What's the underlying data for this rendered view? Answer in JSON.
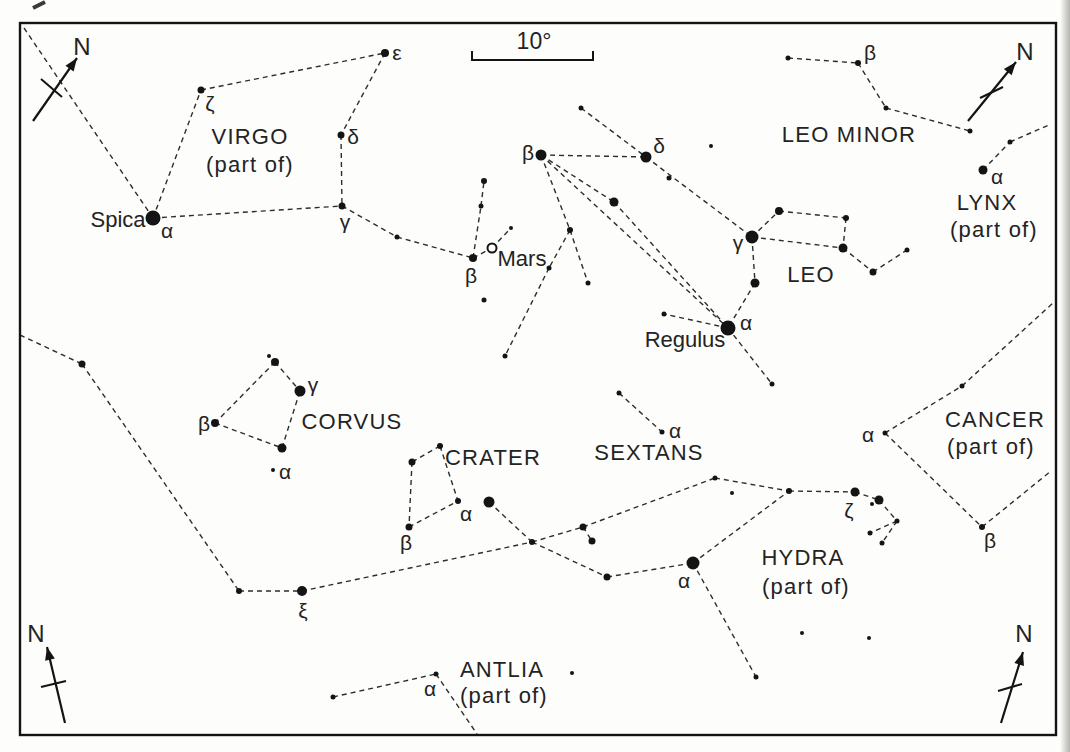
{
  "canvas": {
    "width": 1070,
    "height": 752,
    "background": "#fdfdfb",
    "ink": "#141414",
    "line_color": "#2d2d2d",
    "text_color": "#232323",
    "border": {
      "x": 20,
      "y": 23,
      "width": 1036,
      "height": 712,
      "stroke_width": 2.4
    },
    "page_edge_color": "#bdbdb9"
  },
  "scale_bar": {
    "label": "10°",
    "x1": 472,
    "x2": 593,
    "y": 60,
    "tick_height": 9,
    "label_x": 534,
    "label_y": 41
  },
  "compass_arrows": [
    {
      "id": "north-arrow-top-left",
      "label": "N",
      "shaft": [
        33,
        121,
        77,
        58
      ],
      "tick": [
        41,
        79,
        62,
        97
      ],
      "label_pos": [
        82,
        46
      ]
    },
    {
      "id": "north-arrow-top-right",
      "label": "N",
      "shaft": [
        968,
        121,
        1016,
        62
      ],
      "tick": [
        980,
        98,
        1003,
        87
      ],
      "label_pos": [
        1025,
        51
      ]
    },
    {
      "id": "north-arrow-bottom-left",
      "label": "N",
      "shaft": [
        65,
        723,
        47,
        647
      ],
      "tick": [
        41,
        687,
        66,
        681
      ],
      "label_pos": [
        36,
        633
      ]
    },
    {
      "id": "north-arrow-bottom-right",
      "label": "N",
      "shaft": [
        1001,
        723,
        1023,
        652
      ],
      "tick": [
        998,
        691,
        1022,
        684
      ],
      "label_pos": [
        1024,
        633
      ]
    }
  ],
  "constellation_names": [
    {
      "text": "VIRGO",
      "x": 250,
      "y": 136
    },
    {
      "text": "(part of)",
      "x": 250,
      "y": 164
    },
    {
      "text": "LEO MINOR",
      "x": 849,
      "y": 134
    },
    {
      "text": "LYNX",
      "x": 987,
      "y": 202
    },
    {
      "text": "(part of)",
      "x": 994,
      "y": 229
    },
    {
      "text": "LEO",
      "x": 811,
      "y": 274
    },
    {
      "text": "CANCER",
      "x": 995,
      "y": 419
    },
    {
      "text": "(part of)",
      "x": 991,
      "y": 446
    },
    {
      "text": "CORVUS",
      "x": 352,
      "y": 421
    },
    {
      "text": "CRATER",
      "x": 493,
      "y": 457
    },
    {
      "text": "SEXTANS",
      "x": 649,
      "y": 452
    },
    {
      "text": "HYDRA",
      "x": 803,
      "y": 557
    },
    {
      "text": "(part of)",
      "x": 806,
      "y": 586
    },
    {
      "text": "ANTLIA",
      "x": 502,
      "y": 669
    },
    {
      "text": "(part of)",
      "x": 504,
      "y": 695
    }
  ],
  "star_names": [
    {
      "text": "Spica",
      "x": 118,
      "y": 219
    },
    {
      "text": "Regulus",
      "x": 685,
      "y": 339
    },
    {
      "text": "Mars",
      "x": 522,
      "y": 258
    }
  ],
  "greek_labels": [
    {
      "text": "ζ",
      "x": 210,
      "y": 103
    },
    {
      "text": "ε",
      "x": 397,
      "y": 52
    },
    {
      "text": "δ",
      "x": 353,
      "y": 136
    },
    {
      "text": "γ",
      "x": 345,
      "y": 221
    },
    {
      "text": "α",
      "x": 167,
      "y": 230
    },
    {
      "text": "β",
      "x": 471,
      "y": 275
    },
    {
      "text": "β",
      "x": 528,
      "y": 152
    },
    {
      "text": "δ",
      "x": 659,
      "y": 145
    },
    {
      "text": "γ",
      "x": 738,
      "y": 242
    },
    {
      "text": "α",
      "x": 746,
      "y": 322
    },
    {
      "text": "β",
      "x": 870,
      "y": 52
    },
    {
      "text": "α",
      "x": 997,
      "y": 176
    },
    {
      "text": "α",
      "x": 868,
      "y": 434
    },
    {
      "text": "β",
      "x": 990,
      "y": 540
    },
    {
      "text": "γ",
      "x": 313,
      "y": 384
    },
    {
      "text": "β",
      "x": 204,
      "y": 423
    },
    {
      "text": "α",
      "x": 285,
      "y": 471
    },
    {
      "text": "α",
      "x": 466,
      "y": 513
    },
    {
      "text": "β",
      "x": 406,
      "y": 542
    },
    {
      "text": "α",
      "x": 675,
      "y": 430
    },
    {
      "text": "ξ",
      "x": 303,
      "y": 610
    },
    {
      "text": "α",
      "x": 684,
      "y": 580
    },
    {
      "text": "ζ",
      "x": 849,
      "y": 510
    },
    {
      "text": "α",
      "x": 430,
      "y": 688
    }
  ],
  "mars_marker": {
    "x": 492,
    "y": 248,
    "r": 4.5
  },
  "stars": [
    [
      153,
      218,
      7.5
    ],
    [
      201,
      90,
      3.5
    ],
    [
      385,
      53,
      4
    ],
    [
      341,
      135,
      3.5
    ],
    [
      342,
      206,
      3.5
    ],
    [
      397,
      237,
      2.5
    ],
    [
      473,
      258,
      4
    ],
    [
      481,
      206,
      2.5
    ],
    [
      484,
      181,
      3
    ],
    [
      511,
      228,
      2
    ],
    [
      484,
      300,
      2.5
    ],
    [
      541,
      155,
      5.5
    ],
    [
      646,
      157,
      5.5
    ],
    [
      581,
      108,
      2.5
    ],
    [
      711,
      146,
      2
    ],
    [
      669,
      178,
      2.5
    ],
    [
      614,
      202,
      4.5
    ],
    [
      570,
      230,
      3
    ],
    [
      549,
      268,
      2.5
    ],
    [
      505,
      356,
      2.5
    ],
    [
      588,
      283,
      2.5
    ],
    [
      752,
      237,
      6.5
    ],
    [
      779,
      211,
      4
    ],
    [
      846,
      218,
      3
    ],
    [
      843,
      248,
      4.5
    ],
    [
      873,
      272,
      3.5
    ],
    [
      907,
      250,
      2.5
    ],
    [
      755,
      283,
      4.5
    ],
    [
      728,
      328,
      7.5
    ],
    [
      664,
      314,
      2.5
    ],
    [
      772,
      384,
      2.5
    ],
    [
      788,
      58,
      2.5
    ],
    [
      858,
      63,
      3
    ],
    [
      886,
      108,
      2.5
    ],
    [
      970,
      131,
      2.5
    ],
    [
      983,
      170,
      4.5
    ],
    [
      1010,
      142,
      2.5
    ],
    [
      885,
      433,
      2.5
    ],
    [
      962,
      386,
      2.5
    ],
    [
      982,
      527,
      3
    ],
    [
      269,
      356,
      2
    ],
    [
      275,
      362,
      4
    ],
    [
      300,
      391,
      5.5
    ],
    [
      215,
      423,
      4
    ],
    [
      282,
      448,
      4.5
    ],
    [
      273,
      470,
      2
    ],
    [
      440,
      446,
      3
    ],
    [
      412,
      462,
      3.5
    ],
    [
      409,
      527,
      3.5
    ],
    [
      458,
      501,
      3
    ],
    [
      489,
      502,
      5.5
    ],
    [
      619,
      393,
      2.5
    ],
    [
      662,
      432,
      2.5
    ],
    [
      82,
      364,
      3.5
    ],
    [
      239,
      591,
      3
    ],
    [
      302,
      591,
      5
    ],
    [
      532,
      542,
      3
    ],
    [
      583,
      527,
      3.5
    ],
    [
      592,
      541,
      3.5
    ],
    [
      607,
      577,
      3.5
    ],
    [
      693,
      563,
      6.5
    ],
    [
      715,
      478,
      2.5
    ],
    [
      732,
      493,
      2
    ],
    [
      789,
      491,
      3
    ],
    [
      855,
      492,
      4.5
    ],
    [
      872,
      504,
      2
    ],
    [
      879,
      500,
      4.5
    ],
    [
      897,
      521,
      2.5
    ],
    [
      870,
      533,
      2.5
    ],
    [
      882,
      543,
      2.5
    ],
    [
      756,
      677,
      2.5
    ],
    [
      802,
      633,
      2
    ],
    [
      869,
      638,
      2
    ],
    [
      333,
      697,
      2.5
    ],
    [
      436,
      674,
      2.5
    ],
    [
      572,
      673,
      2
    ]
  ],
  "lines": [
    [
      24,
      28,
      153,
      218
    ],
    [
      153,
      218,
      201,
      90
    ],
    [
      201,
      90,
      385,
      53
    ],
    [
      385,
      53,
      341,
      135
    ],
    [
      341,
      135,
      342,
      206
    ],
    [
      153,
      218,
      342,
      206
    ],
    [
      342,
      206,
      397,
      237
    ],
    [
      397,
      237,
      473,
      258
    ],
    [
      473,
      258,
      481,
      206
    ],
    [
      481,
      206,
      484,
      181
    ],
    [
      473,
      258,
      492,
      248
    ],
    [
      492,
      248,
      511,
      228
    ],
    [
      581,
      108,
      646,
      157
    ],
    [
      541,
      155,
      646,
      157
    ],
    [
      646,
      157,
      752,
      237
    ],
    [
      541,
      155,
      614,
      202
    ],
    [
      614,
      202,
      728,
      328
    ],
    [
      541,
      155,
      728,
      328
    ],
    [
      541,
      155,
      570,
      230
    ],
    [
      570,
      230,
      549,
      268
    ],
    [
      549,
      268,
      505,
      356
    ],
    [
      570,
      230,
      588,
      283
    ],
    [
      752,
      237,
      779,
      211
    ],
    [
      779,
      211,
      846,
      218
    ],
    [
      846,
      218,
      843,
      248
    ],
    [
      752,
      237,
      843,
      248
    ],
    [
      843,
      248,
      873,
      272
    ],
    [
      873,
      272,
      907,
      250
    ],
    [
      752,
      237,
      755,
      283
    ],
    [
      755,
      283,
      728,
      328
    ],
    [
      728,
      328,
      664,
      314
    ],
    [
      728,
      328,
      772,
      384
    ],
    [
      788,
      58,
      858,
      63
    ],
    [
      858,
      63,
      886,
      108
    ],
    [
      886,
      108,
      970,
      131
    ],
    [
      983,
      170,
      1010,
      142
    ],
    [
      1010,
      142,
      1051,
      124
    ],
    [
      885,
      433,
      962,
      386
    ],
    [
      962,
      386,
      1053,
      303
    ],
    [
      885,
      433,
      982,
      527
    ],
    [
      982,
      527,
      1051,
      471
    ],
    [
      275,
      362,
      300,
      391
    ],
    [
      275,
      362,
      215,
      423
    ],
    [
      215,
      423,
      282,
      448
    ],
    [
      282,
      448,
      300,
      391
    ],
    [
      440,
      446,
      412,
      462
    ],
    [
      412,
      462,
      409,
      527
    ],
    [
      409,
      527,
      458,
      501
    ],
    [
      440,
      446,
      458,
      501
    ],
    [
      489,
      502,
      532,
      542
    ],
    [
      619,
      393,
      662,
      432
    ],
    [
      20,
      335,
      82,
      364
    ],
    [
      82,
      364,
      239,
      591
    ],
    [
      239,
      591,
      302,
      591
    ],
    [
      302,
      591,
      532,
      542
    ],
    [
      532,
      542,
      583,
      527
    ],
    [
      583,
      527,
      592,
      541
    ],
    [
      583,
      527,
      715,
      478
    ],
    [
      532,
      542,
      607,
      577
    ],
    [
      607,
      577,
      693,
      563
    ],
    [
      693,
      563,
      789,
      491
    ],
    [
      715,
      478,
      789,
      491
    ],
    [
      789,
      491,
      855,
      492
    ],
    [
      855,
      492,
      879,
      500
    ],
    [
      879,
      500,
      897,
      521
    ],
    [
      897,
      521,
      870,
      533
    ],
    [
      897,
      521,
      882,
      543
    ],
    [
      693,
      563,
      756,
      677
    ],
    [
      333,
      697,
      436,
      674
    ],
    [
      436,
      674,
      477,
      734
    ]
  ],
  "artifact_mark": {
    "x1": 33,
    "y1": 8,
    "x2": 45,
    "y2": 2
  }
}
